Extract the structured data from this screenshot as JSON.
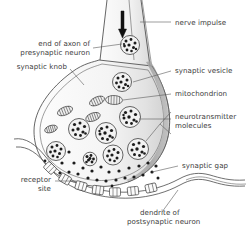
{
  "figure": {
    "background_color": "#ffffff",
    "line_color": "#4a4a4a",
    "text_color": "#3b3b3b",
    "shading_color": "#9a9a9a"
  },
  "labels": {
    "nerve_impulse": "nerve impulse",
    "end_of_axon_line1": "end of axon of",
    "end_of_axon_line2": "presynaptic neuron",
    "synaptic_knob": "synaptic knob",
    "synaptic_vesicle": "synaptic vesicle",
    "mitochondrion": "mitochondrion",
    "neurotransmitter_line1": "neurotransmitter",
    "neurotransmitter_line2": "molecules",
    "synaptic_gap": "synaptic gap",
    "receptor_line1": "receptor",
    "receptor_line2": "site",
    "dendrite_line1": "dendrite of",
    "dendrite_line2": "postsynaptic neuron"
  },
  "structures": {
    "axon": {
      "name": "axon of presynaptic neuron",
      "description": "tapering tube entering from top of figure"
    },
    "synaptic_knob": {
      "name": "synaptic knob",
      "description": "bulbous terminal of the axon containing vesicles and mitochondria"
    },
    "impulse_arrow": {
      "name": "nerve impulse arrow",
      "direction": "downward",
      "x": 122,
      "y_start": 12,
      "y_end": 37
    },
    "synaptic_vesicles": [
      {
        "cx": 130,
        "cy": 45,
        "r": 9.5
      },
      {
        "cx": 122,
        "cy": 82,
        "r": 9.5
      },
      {
        "cx": 130,
        "cy": 117,
        "r": 10.5
      },
      {
        "cx": 79,
        "cy": 129,
        "r": 10.5
      },
      {
        "cx": 106,
        "cy": 133,
        "r": 10.5
      },
      {
        "cx": 138,
        "cy": 149,
        "r": 10.5
      },
      {
        "cx": 113,
        "cy": 155,
        "r": 10.0
      },
      {
        "cx": 56,
        "cy": 151,
        "r": 9.5
      },
      {
        "cx": 90,
        "cy": 159,
        "r": 6.5
      }
    ],
    "mitochondria": [
      {
        "cx": 65,
        "cy": 111,
        "rx": 8.0,
        "ry": 4.0,
        "angle": -22
      },
      {
        "cx": 97,
        "cy": 101,
        "rx": 8.0,
        "ry": 4.0,
        "angle": -24
      },
      {
        "cx": 114,
        "cy": 100,
        "rx": 8.5,
        "ry": 4.5,
        "angle": 2
      },
      {
        "cx": 93,
        "cy": 117,
        "rx": 7.5,
        "ry": 4.0,
        "angle": -20
      },
      {
        "cx": 51,
        "cy": 129,
        "rx": 6.5,
        "ry": 3.5,
        "angle": -18
      }
    ],
    "receptor_sites": [
      {
        "cx": 50,
        "cy": 168,
        "angle": 40
      },
      {
        "cx": 65,
        "cy": 179,
        "angle": 28
      },
      {
        "cx": 80,
        "cy": 185,
        "angle": 14
      },
      {
        "cx": 96,
        "cy": 189,
        "angle": 6
      },
      {
        "cx": 113,
        "cy": 191,
        "angle": 0
      },
      {
        "cx": 130,
        "cy": 190,
        "angle": -6
      },
      {
        "cx": 147,
        "cy": 187,
        "angle": -12
      }
    ],
    "neurotransmitter_dot_count": 28,
    "dendrite": {
      "name": "dendrite of postsynaptic neuron",
      "description": "wavy membrane band running along the bottom of the figure"
    },
    "synaptic_gap": {
      "name": "synaptic gap",
      "description": "space between synaptic knob and dendrite membrane containing neurotransmitter molecules"
    }
  }
}
